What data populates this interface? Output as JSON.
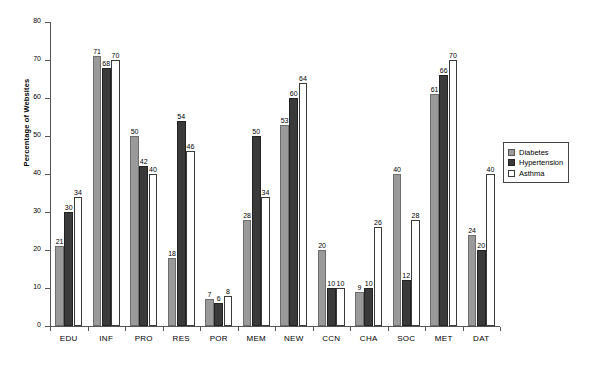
{
  "chart_data": {
    "type": "bar",
    "title": "",
    "xlabel": "",
    "ylabel": "Percentage of Websites",
    "ylim": [
      0,
      80
    ],
    "yticks": [
      0,
      10,
      20,
      30,
      40,
      50,
      60,
      70,
      80
    ],
    "grid": false,
    "legend_position": "right",
    "categories": [
      "EDU",
      "INF",
      "PRO",
      "RES",
      "POR",
      "MEM",
      "NEW",
      "CCN",
      "CHA",
      "SOC",
      "MET",
      "DAT"
    ],
    "series": [
      {
        "name": "Diabetes",
        "color": "#9a9a9a",
        "values": [
          21,
          71,
          50,
          18,
          7,
          28,
          53,
          20,
          9,
          40,
          61,
          24
        ]
      },
      {
        "name": "Hypertension",
        "color": "#3a3a3a",
        "values": [
          30,
          68,
          42,
          54,
          6,
          50,
          60,
          10,
          10,
          12,
          66,
          20
        ]
      },
      {
        "name": "Asthma",
        "color": "#ffffff",
        "values": [
          34,
          70,
          40,
          46,
          8,
          34,
          64,
          10,
          26,
          28,
          70,
          40
        ]
      }
    ]
  },
  "legend": {
    "items": [
      {
        "label": "Diabetes"
      },
      {
        "label": "Hypertension"
      },
      {
        "label": "Asthma"
      }
    ]
  }
}
